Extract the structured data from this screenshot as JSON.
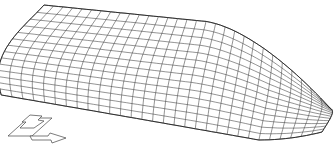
{
  "figure": {
    "type": "wireframe-surface-mesh",
    "colors": {
      "background": "#ffffff",
      "mesh_line": "#3a3a3a",
      "outline": "#222222"
    },
    "mesh": {
      "streamwise_divisions": 30,
      "spanwise_divisions": 14
    },
    "axis_indicator": {
      "arrows": [
        "up-arrow",
        "right-arrow"
      ],
      "position": "bottom-left"
    }
  }
}
